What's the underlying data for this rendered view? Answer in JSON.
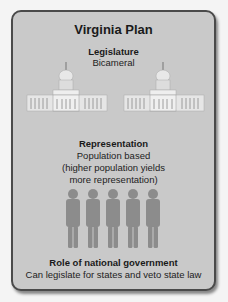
{
  "title": "Virginia Plan",
  "sections": [
    {
      "heading": "Legislature",
      "body": [
        "Bicameral"
      ],
      "icon": "capitol-building-icon",
      "icon_count": 2
    },
    {
      "heading": "Representation",
      "body": [
        "Population based",
        "(higher population yields",
        "more representation)"
      ],
      "icon": "person-figure-icon",
      "icon_count": 5
    },
    {
      "heading": "Role of national government",
      "body": [
        "Can legislate for states and veto state law"
      ]
    }
  ],
  "colors": {
    "card_bg": "#c9c9c9",
    "border": "#4a4a4a",
    "figure": "#8a8a8a",
    "page_bg": "#f4f4f4"
  }
}
